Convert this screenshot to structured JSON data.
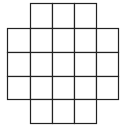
{
  "diagram": {
    "type": "grid-cross",
    "line_color": "#222222",
    "background": "#ffffff",
    "col_edges": [
      7,
      30,
      52,
      74,
      96,
      118
    ],
    "row_edges": [
      3,
      28,
      52,
      76,
      99,
      123
    ],
    "rows": [
      {
        "cols": [
          1,
          2,
          3
        ]
      },
      {
        "cols": [
          0,
          1,
          2,
          3,
          4
        ]
      },
      {
        "cols": [
          0,
          1,
          2,
          3,
          4
        ]
      },
      {
        "cols": [
          0,
          1,
          2,
          3,
          4
        ]
      },
      {
        "cols": [
          1,
          2,
          3
        ]
      }
    ],
    "cell_count": 21
  }
}
